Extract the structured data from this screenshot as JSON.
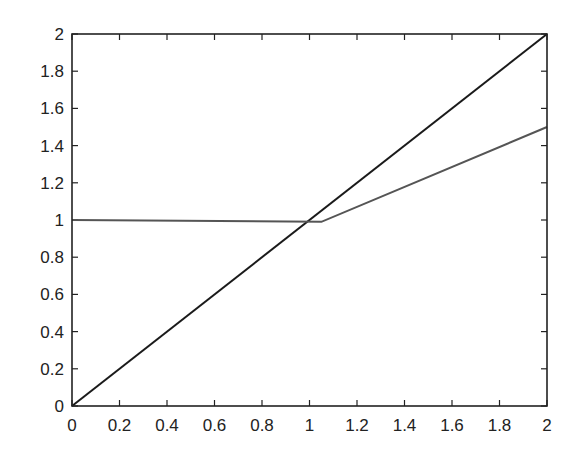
{
  "chart_data": {
    "type": "line",
    "title": "",
    "xlabel": "",
    "ylabel": "",
    "xlim": [
      0,
      2
    ],
    "ylim": [
      0,
      2
    ],
    "grid": false,
    "legend": null,
    "x_ticks": [
      "0",
      "0.2",
      "0.4",
      "0.6",
      "0.8",
      "1",
      "1.2",
      "1.4",
      "1.6",
      "1.8",
      "2"
    ],
    "y_ticks": [
      "0",
      "0.2",
      "0.4",
      "0.6",
      "0.8",
      "1",
      "1.2",
      "1.4",
      "1.6",
      "1.8",
      "2"
    ],
    "series": [
      {
        "name": "identity",
        "color": "#1a1a1a",
        "x": [
          0,
          2
        ],
        "y": [
          0,
          2
        ]
      },
      {
        "name": "piecewise",
        "color": "#555555",
        "x": [
          0,
          1.05,
          2
        ],
        "y": [
          1.0,
          0.99,
          1.5
        ]
      }
    ]
  }
}
